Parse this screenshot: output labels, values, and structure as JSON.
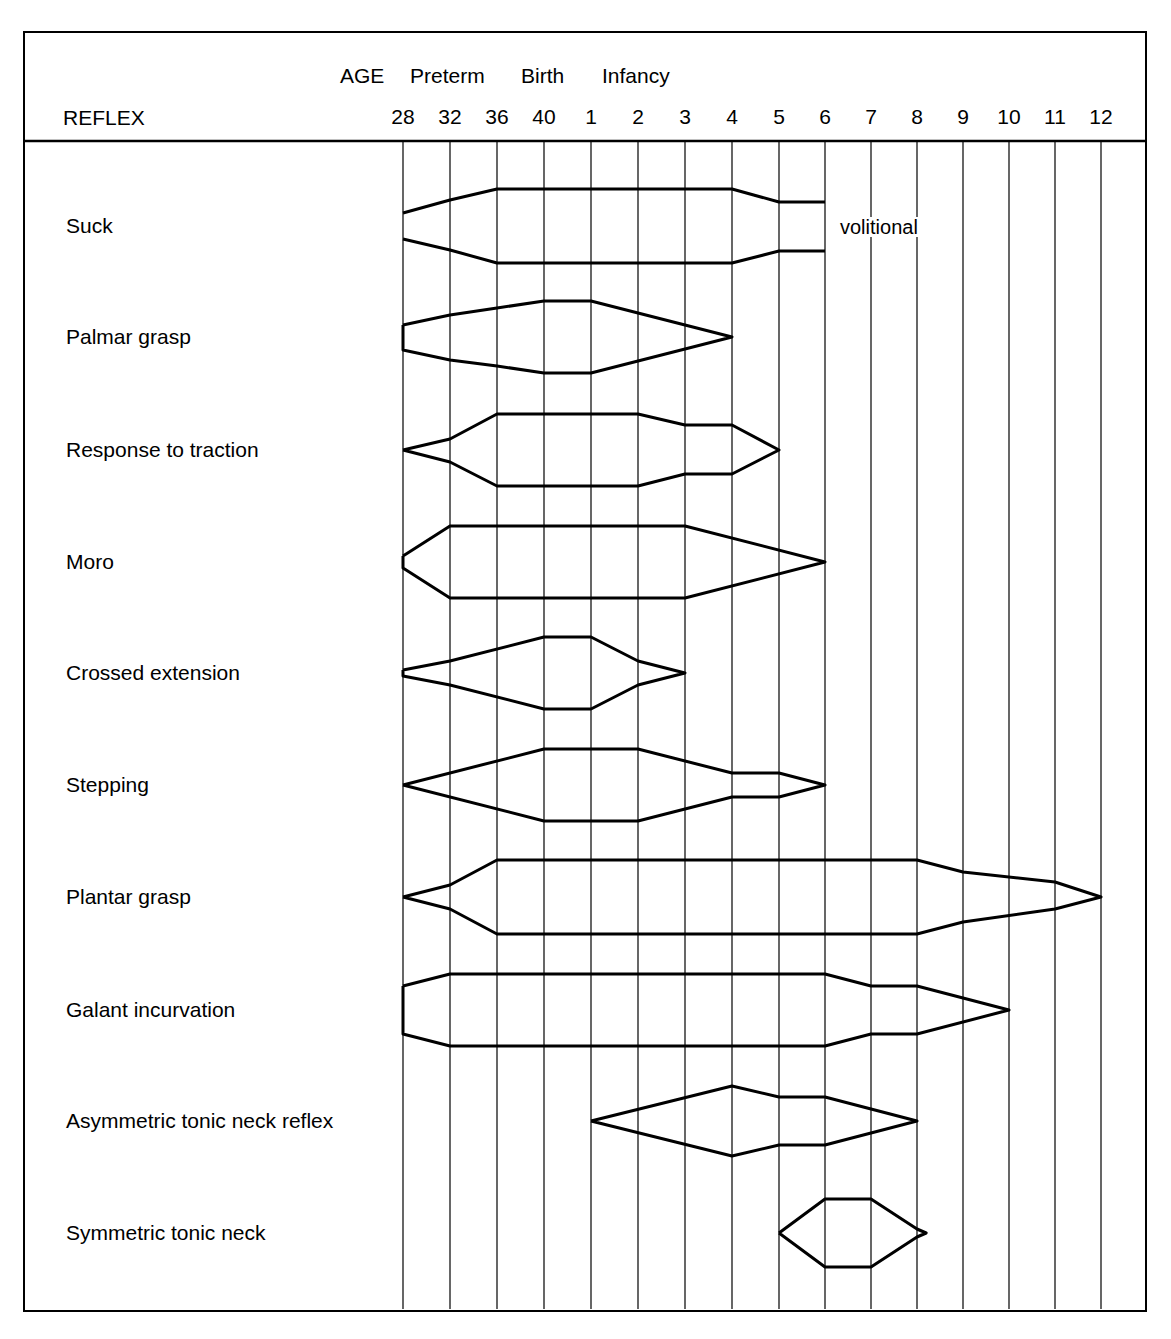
{
  "chart_data": {
    "type": "table",
    "header": {
      "row_label": "REFLEX",
      "age_label": "AGE",
      "period_labels": [
        {
          "text": "Preterm",
          "x": 410
        },
        {
          "text": "Birth",
          "x": 521
        },
        {
          "text": "Infancy",
          "x": 602
        }
      ]
    },
    "x_ticks": [
      "28",
      "32",
      "36",
      "40",
      "1",
      "2",
      "3",
      "4",
      "5",
      "6",
      "7",
      "8",
      "9",
      "10",
      "11",
      "12"
    ],
    "x_tick_units": "weeks gestation (28-40), then months (1-12)",
    "grid_x": [
      403,
      450,
      497,
      544,
      591,
      638,
      685,
      732,
      779,
      825,
      871,
      917,
      963,
      1009,
      1055,
      1101
    ],
    "annotations": [
      {
        "text": "volitional",
        "row": "Suck",
        "x": 838,
        "y": 217
      }
    ],
    "series": [
      {
        "name": "Suck",
        "cy": 226,
        "onset": "28",
        "offset": "6",
        "open_end": true,
        "top": [
          [
            0,
            -13
          ],
          [
            1,
            -26
          ],
          [
            2,
            -37
          ],
          [
            7,
            -37
          ],
          [
            8,
            -24
          ],
          [
            9,
            -24
          ]
        ],
        "bottom": [
          [
            0,
            13
          ],
          [
            1,
            24
          ],
          [
            2,
            37
          ],
          [
            7,
            37
          ],
          [
            8,
            25
          ],
          [
            9,
            25
          ]
        ]
      },
      {
        "name": "Palmar grasp",
        "cy": 337,
        "onset": "28",
        "offset": "4",
        "top": [
          [
            0,
            -12
          ],
          [
            1,
            -22
          ],
          [
            2,
            -29
          ],
          [
            3,
            -36
          ],
          [
            4,
            -36
          ],
          [
            7,
            0
          ]
        ],
        "bottom": [
          [
            0,
            13
          ],
          [
            1,
            23
          ],
          [
            2,
            29
          ],
          [
            3,
            36
          ],
          [
            4,
            36
          ],
          [
            7,
            0
          ]
        ]
      },
      {
        "name": "Response to traction",
        "cy": 450,
        "onset": "28",
        "offset": "5",
        "top": [
          [
            0,
            0
          ],
          [
            1,
            -11
          ],
          [
            2,
            -36
          ],
          [
            5,
            -36
          ],
          [
            6,
            -25
          ],
          [
            7,
            -25
          ],
          [
            8,
            0
          ]
        ],
        "bottom": [
          [
            0,
            0
          ],
          [
            1,
            12
          ],
          [
            2,
            36
          ],
          [
            5,
            36
          ],
          [
            6,
            24
          ],
          [
            7,
            24
          ],
          [
            8,
            0
          ]
        ]
      },
      {
        "name": "Moro",
        "cy": 562,
        "onset": "28",
        "offset": "6",
        "top": [
          [
            0,
            -6
          ],
          [
            1,
            -36
          ],
          [
            6,
            -36
          ],
          [
            9,
            0
          ]
        ],
        "bottom": [
          [
            0,
            6
          ],
          [
            1,
            36
          ],
          [
            6,
            36
          ],
          [
            9,
            0
          ]
        ]
      },
      {
        "name": "Crossed extension",
        "cy": 673,
        "onset": "28",
        "offset": "3",
        "top": [
          [
            0,
            -3
          ],
          [
            1,
            -12
          ],
          [
            3,
            -36
          ],
          [
            4,
            -36
          ],
          [
            5,
            -12
          ],
          [
            6,
            0
          ]
        ],
        "bottom": [
          [
            0,
            3
          ],
          [
            1,
            12
          ],
          [
            3,
            36
          ],
          [
            4,
            36
          ],
          [
            5,
            12
          ],
          [
            6,
            0
          ]
        ]
      },
      {
        "name": "Stepping",
        "cy": 785,
        "onset": "28",
        "offset": "6",
        "top": [
          [
            0,
            0
          ],
          [
            3,
            -36
          ],
          [
            5,
            -36
          ],
          [
            7,
            -12
          ],
          [
            8,
            -12
          ],
          [
            9,
            0
          ]
        ],
        "bottom": [
          [
            0,
            0
          ],
          [
            3,
            36
          ],
          [
            5,
            36
          ],
          [
            7,
            12
          ],
          [
            8,
            12
          ],
          [
            9,
            0
          ]
        ]
      },
      {
        "name": "Plantar grasp",
        "cy": 897,
        "onset": "28",
        "offset": "12",
        "top": [
          [
            0,
            0
          ],
          [
            1,
            -12
          ],
          [
            2,
            -37
          ],
          [
            11,
            -37
          ],
          [
            12,
            -25
          ],
          [
            14,
            -15
          ],
          [
            15,
            0
          ]
        ],
        "bottom": [
          [
            0,
            0
          ],
          [
            1,
            12
          ],
          [
            2,
            37
          ],
          [
            11,
            37
          ],
          [
            12,
            25
          ],
          [
            14,
            12
          ],
          [
            15,
            0
          ]
        ]
      },
      {
        "name": "Galant incurvation",
        "cy": 1010,
        "onset": "28",
        "offset": "10",
        "top": [
          [
            0,
            -24
          ],
          [
            1,
            -36
          ],
          [
            9,
            -36
          ],
          [
            10,
            -24
          ],
          [
            11,
            -24
          ],
          [
            13,
            0
          ]
        ],
        "bottom": [
          [
            0,
            24
          ],
          [
            1,
            36
          ],
          [
            9,
            36
          ],
          [
            10,
            24
          ],
          [
            11,
            24
          ],
          [
            13,
            0
          ]
        ]
      },
      {
        "name": "Asymmetric tonic neck reflex",
        "cy": 1121,
        "onset": "1",
        "offset": "8",
        "top": [
          [
            4,
            0
          ],
          [
            7,
            -35
          ],
          [
            8,
            -24
          ],
          [
            9,
            -24
          ],
          [
            11,
            0
          ]
        ],
        "bottom": [
          [
            4,
            0
          ],
          [
            7,
            35
          ],
          [
            8,
            24
          ],
          [
            9,
            24
          ],
          [
            11,
            0
          ]
        ]
      },
      {
        "name": "Symmetric tonic neck",
        "cy": 1233,
        "onset": "5",
        "offset": "8",
        "top": [
          [
            8,
            0
          ],
          [
            9,
            -34
          ],
          [
            10,
            -34
          ],
          [
            11,
            -4
          ],
          [
            11.2,
            0
          ]
        ],
        "bottom": [
          [
            8,
            0
          ],
          [
            9,
            34
          ],
          [
            10,
            34
          ],
          [
            11,
            4
          ],
          [
            11.2,
            0
          ]
        ]
      }
    ],
    "xlabel": "AGE",
    "ylabel": "REFLEX",
    "grid": true,
    "legend": null
  }
}
